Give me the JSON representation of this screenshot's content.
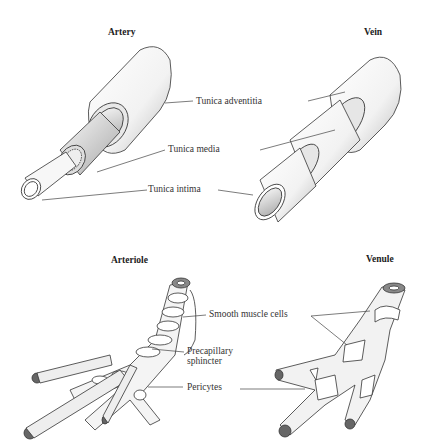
{
  "figure": {
    "panels": [
      {
        "id": "artery",
        "title": "Artery"
      },
      {
        "id": "vein",
        "title": "Vein"
      },
      {
        "id": "arteriole",
        "title": "Arteriole"
      },
      {
        "id": "venule",
        "title": "Venule"
      }
    ],
    "labels": {
      "tunica_adventitia": "Tunica adventitia",
      "tunica_media": "Tunica media",
      "tunica_intima": "Tunica intima",
      "smooth_muscle_cells": "Smooth muscle cells",
      "precapillary_line1": "Precapillary",
      "precapillary_line2": "sphincter",
      "pericytes": "Pericytes"
    }
  }
}
